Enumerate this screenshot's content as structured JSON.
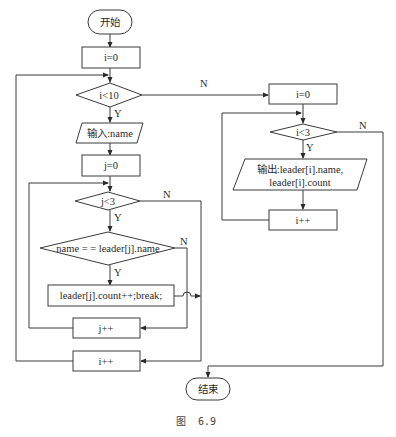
{
  "figure": {
    "caption_prefix": "图",
    "caption_number": "6.9"
  },
  "nodes": {
    "start": "开始",
    "init_i": "i=0",
    "cond_i10": "i<10",
    "input_name": "输入:name",
    "init_j": "j=0",
    "cond_j3": "j<3",
    "cond_name": "name = = leader[j].name",
    "count_break": "leader[j].count++;break;",
    "inc_j": "j++",
    "inc_i": "i++",
    "init_i2": "i=0",
    "cond_i3": "i<3",
    "output_line1": "输出:leader[i].name,",
    "output_line2": "leader[i].count",
    "inc_i2": "i++",
    "end": "结束"
  },
  "edge_labels": {
    "yes": "Y",
    "no": "N"
  },
  "colors": {
    "line": "#3a3a3a",
    "text": "#2a2a2a",
    "background": "#ffffff"
  }
}
